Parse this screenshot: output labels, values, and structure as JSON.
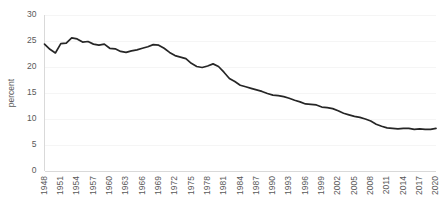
{
  "chart_data": {
    "type": "line",
    "title": "",
    "subtitle": "",
    "xlabel": "",
    "ylabel": "percent",
    "ylim": [
      0,
      30
    ],
    "ytick_step": 5,
    "yticks": [
      "0",
      "5",
      "10",
      "15",
      "20",
      "25",
      "30"
    ],
    "xlim": [
      1948,
      2020
    ],
    "xticks": [
      "1948",
      "1951",
      "1954",
      "1957",
      "1960",
      "1963",
      "1966",
      "1969",
      "1972",
      "1975",
      "1978",
      "1981",
      "1984",
      "1987",
      "1990",
      "1993",
      "1996",
      "1999",
      "2002",
      "2005",
      "2008",
      "2011",
      "2014",
      "2017",
      "2020"
    ],
    "xtick_step": 3,
    "xtick_rotation": -90,
    "grid": true,
    "grid_axis": "y",
    "legend": false,
    "legend_position": "none",
    "line_color": "#262626",
    "grid_color": "#f2f2f2",
    "axis_color": "#d9d9d9",
    "tick_label_color": "#595959",
    "series": [
      {
        "name": "percent",
        "x": [
          1948,
          1949,
          1950,
          1951,
          1952,
          1953,
          1954,
          1955,
          1956,
          1957,
          1958,
          1959,
          1960,
          1961,
          1962,
          1963,
          1964,
          1965,
          1966,
          1967,
          1968,
          1969,
          1970,
          1971,
          1972,
          1973,
          1974,
          1975,
          1976,
          1977,
          1978,
          1979,
          1980,
          1981,
          1982,
          1983,
          1984,
          1985,
          1986,
          1987,
          1988,
          1989,
          1990,
          1991,
          1992,
          1993,
          1994,
          1995,
          1996,
          1997,
          1998,
          1999,
          2000,
          2001,
          2002,
          2003,
          2004,
          2005,
          2006,
          2007,
          2008,
          2009,
          2010,
          2011,
          2012,
          2013,
          2014,
          2015,
          2016,
          2017,
          2018,
          2019,
          2020
        ],
        "values": [
          24.4,
          23.4,
          22.7,
          24.5,
          24.6,
          25.6,
          25.4,
          24.8,
          24.9,
          24.4,
          24.2,
          24.4,
          23.6,
          23.5,
          23.0,
          22.8,
          23.1,
          23.3,
          23.6,
          23.9,
          24.3,
          24.2,
          23.6,
          22.8,
          22.2,
          21.9,
          21.6,
          20.7,
          20.1,
          19.9,
          20.2,
          20.6,
          20.1,
          19.0,
          17.8,
          17.2,
          16.5,
          16.2,
          15.9,
          15.6,
          15.3,
          14.9,
          14.6,
          14.5,
          14.3,
          14.0,
          13.6,
          13.3,
          12.9,
          12.8,
          12.7,
          12.3,
          12.2,
          12.0,
          11.6,
          11.1,
          10.8,
          10.5,
          10.3,
          10.0,
          9.6,
          9.0,
          8.6,
          8.3,
          8.2,
          8.1,
          8.2,
          8.2,
          8.0,
          8.1,
          8.0,
          8.0,
          8.2
        ]
      }
    ],
    "annotations": []
  }
}
